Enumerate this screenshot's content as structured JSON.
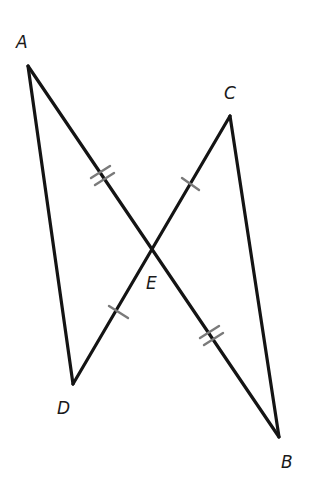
{
  "diagram": {
    "type": "geometry",
    "colors": {
      "background": "#ffffff",
      "segment": "#141414",
      "tick": "#7a7a7a"
    },
    "points": {
      "A": {
        "x": 28,
        "y": 66,
        "label": "A",
        "label_x": 16,
        "label_y": 48
      },
      "C": {
        "x": 230,
        "y": 116,
        "label": "C",
        "label_x": 224,
        "label_y": 99
      },
      "E": {
        "x": 153,
        "y": 250,
        "label": "E",
        "label_x": 146,
        "label_y": 289
      },
      "D": {
        "x": 73,
        "y": 384,
        "label": "D",
        "label_x": 57,
        "label_y": 414
      },
      "B": {
        "x": 279,
        "y": 437,
        "label": "B",
        "label_x": 281,
        "label_y": 468
      }
    },
    "segments": [
      {
        "from": "A",
        "to": "B",
        "name": "AB"
      },
      {
        "from": "C",
        "to": "D",
        "name": "CD"
      },
      {
        "from": "A",
        "to": "D",
        "name": "AD"
      },
      {
        "from": "C",
        "to": "B",
        "name": "CB"
      }
    ],
    "congruence_marks": [
      {
        "segment": "AE",
        "ticks": 2
      },
      {
        "segment": "EB",
        "ticks": 2
      },
      {
        "segment": "CE",
        "ticks": 1
      },
      {
        "segment": "ED",
        "ticks": 1
      }
    ]
  }
}
